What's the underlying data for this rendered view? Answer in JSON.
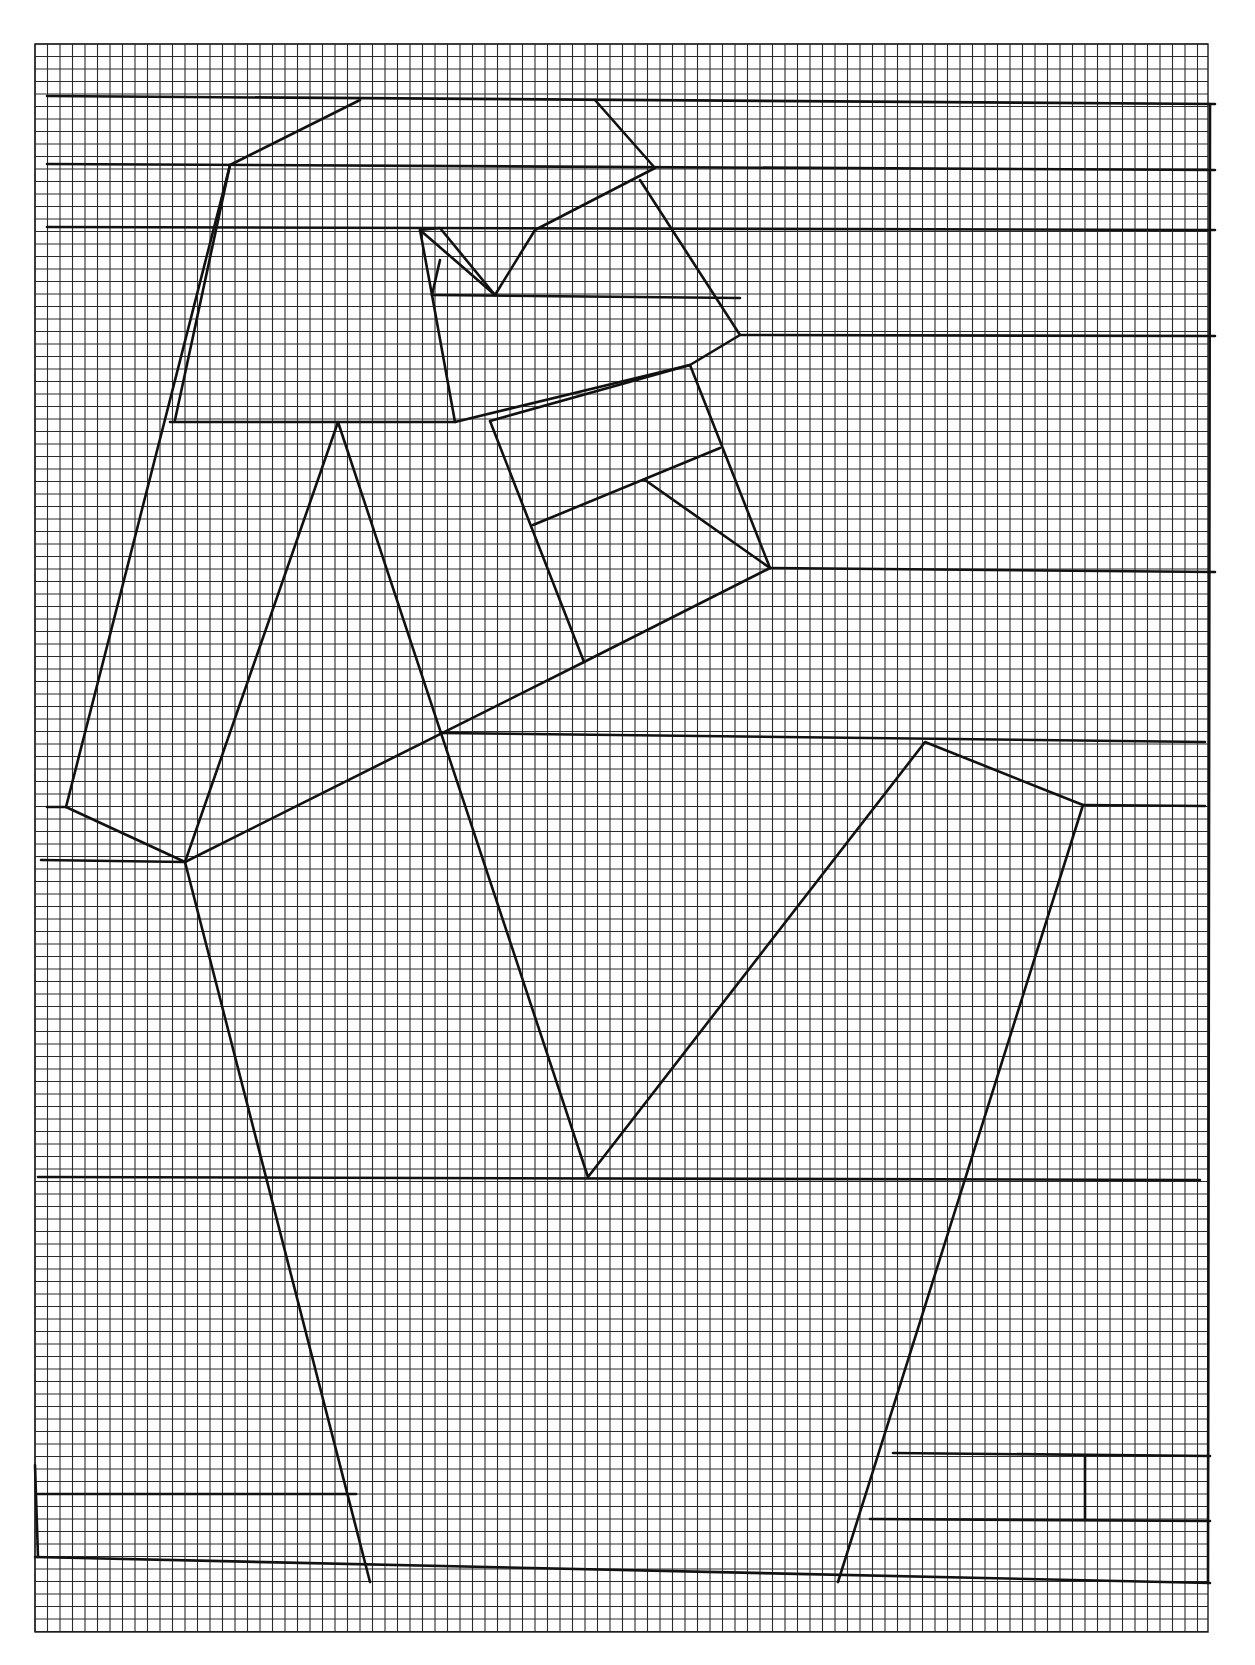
{
  "artwork": {
    "background": "#ffffff",
    "ink_color": "#111111",
    "grid": {
      "left": 35,
      "top": 44,
      "right": 1208,
      "bottom": 1632,
      "cell": 12.5
    },
    "segments": [
      [
        [
          47,
          96
        ],
        [
          1215,
          104
        ]
      ],
      [
        [
          47,
          164
        ],
        [
          1215,
          170
        ]
      ],
      [
        [
          47,
          227
        ],
        [
          1215,
          230
        ]
      ],
      [
        [
          360,
          100
        ],
        [
          230,
          165
        ],
        [
          66,
          807
        ],
        [
          47,
          807
        ]
      ],
      [
        [
          230,
          165
        ],
        [
          175,
          420
        ]
      ],
      [
        [
          595,
          100
        ],
        [
          655,
          168
        ],
        [
          535,
          230
        ],
        [
          495,
          295
        ],
        [
          440,
          228
        ],
        [
          420,
          230
        ],
        [
          432,
          295
        ],
        [
          455,
          422
        ],
        [
          170,
          422
        ]
      ],
      [
        [
          432,
          295
        ],
        [
          740,
          298
        ]
      ],
      [
        [
          440,
          260
        ],
        [
          432,
          295
        ]
      ],
      [
        [
          420,
          230
        ],
        [
          495,
          295
        ]
      ],
      [
        [
          640,
          180
        ],
        [
          740,
          335
        ],
        [
          690,
          365
        ],
        [
          455,
          422
        ]
      ],
      [
        [
          740,
          335
        ],
        [
          1215,
          336
        ]
      ],
      [
        [
          690,
          365
        ],
        [
          770,
          568
        ],
        [
          584,
          662
        ],
        [
          490,
          421
        ],
        [
          690,
          365
        ]
      ],
      [
        [
          533,
          525
        ],
        [
          720,
          448
        ]
      ],
      [
        [
          645,
          480
        ],
        [
          770,
          568
        ]
      ],
      [
        [
          770,
          568
        ],
        [
          1215,
          572
        ]
      ],
      [
        [
          584,
          662
        ],
        [
          185,
          862
        ],
        [
          66,
          807
        ]
      ],
      [
        [
          185,
          862
        ],
        [
          41,
          860
        ]
      ],
      [
        [
          185,
          862
        ],
        [
          338,
          422
        ],
        [
          588,
          1177
        ],
        [
          925,
          742
        ],
        [
          1083,
          805
        ],
        [
          838,
          1582
        ]
      ],
      [
        [
          440,
          733
        ],
        [
          1205,
          742
        ]
      ],
      [
        [
          1083,
          805
        ],
        [
          1205,
          806
        ]
      ],
      [
        [
          185,
          862
        ],
        [
          370,
          1582
        ]
      ],
      [
        [
          38,
          1177
        ],
        [
          1200,
          1180
        ]
      ],
      [
        [
          38,
          1494
        ],
        [
          356,
          1494
        ]
      ],
      [
        [
          38,
          1557
        ],
        [
          35,
          1465
        ]
      ],
      [
        [
          35,
          1557
        ],
        [
          1210,
          1583
        ]
      ],
      [
        [
          893,
          1453
        ],
        [
          1210,
          1456
        ]
      ],
      [
        [
          870,
          1519
        ],
        [
          1210,
          1521
        ]
      ],
      [
        [
          1085,
          1456
        ],
        [
          1085,
          1519
        ]
      ],
      [
        [
          1210,
          104
        ],
        [
          1208,
          1583
        ]
      ]
    ]
  }
}
